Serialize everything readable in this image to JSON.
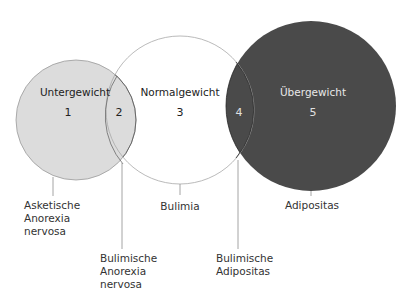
{
  "colors": {
    "background": "#ffffff",
    "underweight_fill": "#dcdcdc",
    "underweight_stroke": "#9a9a9a",
    "normal_fill": "#ffffff",
    "normal_stroke": "#a8a8a8",
    "overweight_fill": "#4a4a4a",
    "overlap_outline": "#2a2a2a"
  },
  "circles": [
    {
      "id": "underweight",
      "label": "Untergewicht",
      "number": "1"
    },
    {
      "id": "normal",
      "label": "Normalgewicht",
      "number": "3"
    },
    {
      "id": "overweight",
      "label": "Übergewicht",
      "number": "5"
    }
  ],
  "overlaps": [
    {
      "id": "under-normal",
      "number": "2"
    },
    {
      "id": "normal-over",
      "number": "4"
    }
  ],
  "captions": {
    "asketische": [
      "Asketische",
      "Anorexia",
      "nervosa"
    ],
    "bulimische_anorexia": [
      "Bulimische",
      "Anorexia",
      "nervosa"
    ],
    "bulimia": [
      "Bulimia"
    ],
    "bulimische_adipositas": [
      "Bulimische",
      "Adipositas"
    ],
    "adipositas": [
      "Adipositas"
    ]
  }
}
